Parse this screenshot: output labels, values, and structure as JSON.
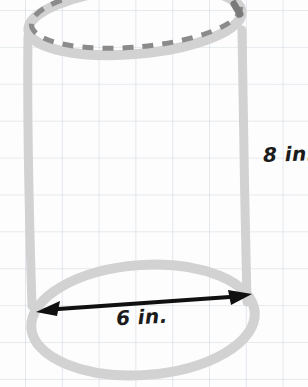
{
  "scene": {
    "kind": "hand-drawn-geometry-figure",
    "subject": "cylinder",
    "background": "graph-paper",
    "paper_color": "#fdfdfd",
    "grid_line_color": "#b0becd",
    "grid_spacing_px": 37
  },
  "figure": {
    "stroke_color": "#d0d0d0",
    "hidden_edge_color": "#888888",
    "annotation_color": "#1b1b1b",
    "parts": {
      "top_face": "dashed-ellipse-hidden-back-edge",
      "bottom_face": "solid-ellipse",
      "left_wall": "vertical-stroke",
      "right_wall": "vertical-stroke"
    }
  },
  "labels": {
    "height": {
      "text": "8 in.",
      "value": 8,
      "unit": "in.",
      "measures": "height",
      "clipped_at_right_edge": true
    },
    "diameter": {
      "text": "6 in.",
      "value": 6,
      "unit": "in.",
      "measures": "diameter"
    }
  },
  "annotations": {
    "diameter_arrow": {
      "style": "double-headed",
      "color": "#101010"
    }
  }
}
